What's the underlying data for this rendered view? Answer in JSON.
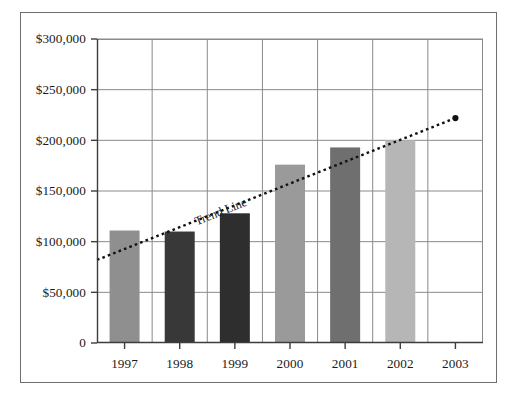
{
  "chart_data": {
    "type": "bar",
    "title": "",
    "subtitle": "",
    "xlabel": "",
    "ylabel": "",
    "categories": [
      "1997",
      "1998",
      "1999",
      "2000",
      "2001",
      "2002",
      "2003"
    ],
    "values": [
      111000,
      110000,
      128000,
      176000,
      193000,
      200000,
      null
    ],
    "bar_colors": [
      "#8f8f8f",
      "#383838",
      "#2e2e2e",
      "#9a9a9a",
      "#6f6f6f",
      "#b6b6b6"
    ],
    "ylim": [
      0,
      300000
    ],
    "xlim_categories": [
      "1997",
      "2003"
    ],
    "ytick_values": [
      0,
      50000,
      100000,
      150000,
      200000,
      250000,
      300000
    ],
    "ytick_labels": [
      "0",
      "$50,000",
      "$100,000",
      "$150,000",
      "$200,000",
      "$250,000",
      "$300,000"
    ],
    "xtick_labels": [
      "1997",
      "1998",
      "1999",
      "2000",
      "2001",
      "2002",
      "2003"
    ],
    "grid": true,
    "grid_axis": "both",
    "legend": false,
    "legend_position": "none",
    "annotations": [
      {
        "name": "trend-line",
        "label": "Trend Line",
        "style": "dotted",
        "color": "#111111",
        "start": {
          "x": "1997",
          "y": 82000
        },
        "end": {
          "x": "2003",
          "y": 222000
        },
        "end_marker": "filled-circle"
      }
    ],
    "series": [
      {
        "name": "Annual Value",
        "values": [
          111000,
          110000,
          128000,
          176000,
          193000,
          200000,
          null
        ]
      }
    ]
  },
  "frame": {
    "border_color": "#6e6e6e",
    "background": "#ffffff"
  },
  "axis_style": {
    "axis_color": "#3d3d3d",
    "grid_color": "#8a8a8a",
    "tick_color": "#3d3d3d",
    "text_color": "#1a1a1a"
  }
}
